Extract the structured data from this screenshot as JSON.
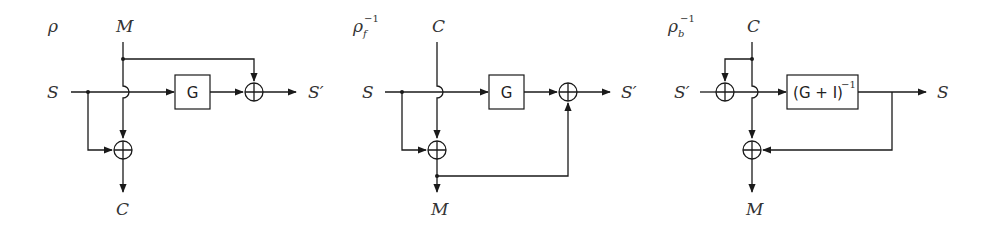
{
  "diagrams": [
    {
      "title": {
        "symbol": "ρ",
        "sub": "",
        "sup": ""
      },
      "top_input": "M",
      "left_input": "S",
      "right_output": "S′",
      "bottom_output": "C",
      "box_label": "G"
    },
    {
      "title": {
        "symbol": "ρ",
        "sub": "f",
        "sup": "−1"
      },
      "top_input": "C",
      "left_input": "S",
      "right_output": "S′",
      "bottom_output": "M",
      "box_label": "G"
    },
    {
      "title": {
        "symbol": "ρ",
        "sub": "b",
        "sup": "−1"
      },
      "top_input": "C",
      "left_input": "S′",
      "right_output": "S",
      "bottom_output": "M",
      "box_label": "(G + I)",
      "box_sup": "−1"
    }
  ],
  "colors": {
    "stroke": "#1a1a1a",
    "text": "#333333",
    "background": "#ffffff"
  }
}
